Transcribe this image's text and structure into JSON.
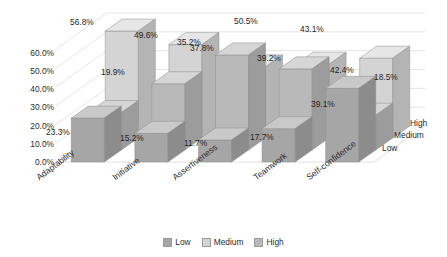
{
  "chart_data": {
    "type": "bar",
    "title": "",
    "subtitle": "",
    "xlabel": "",
    "ylabel": "",
    "categories": [
      "Adaptability",
      "Initiative",
      "Assertiveness",
      "Teamwork",
      "Self-confidence"
    ],
    "series": [
      {
        "name": "Low",
        "values": [
          23.3,
          15.2,
          11.7,
          17.7,
          39.1
        ]
      },
      {
        "name": "Medium",
        "values": [
          56.8,
          49.6,
          37.8,
          39.2,
          42.4
        ]
      },
      {
        "name": "High",
        "values": [
          19.9,
          35.2,
          50.5,
          43.1,
          18.5
        ]
      }
    ],
    "value_labels": {
      "Low": [
        "23.3%",
        "15.2%",
        "11.7%",
        "17.7%",
        "39.1%"
      ],
      "Medium": [
        "56.8%",
        "49.6%",
        "37.8%",
        "39.2%",
        "42.4%"
      ],
      "High": [
        "19.9%",
        "35.2%",
        "50.5%",
        "43.1%",
        "18.5%"
      ]
    },
    "ylim": [
      0,
      60
    ],
    "ytick_labels": [
      "0.0%",
      "10.0%",
      "20.0%",
      "30.0%",
      "40.0%",
      "50.0%",
      "60.0%"
    ],
    "ytick_values": [
      0,
      10,
      20,
      30,
      40,
      50,
      60
    ],
    "depth_axis_labels": [
      "High",
      "Medium",
      "Low"
    ],
    "legend": {
      "position": "bottom",
      "entries": [
        "Low",
        "Medium",
        "High"
      ]
    },
    "grid": true,
    "three_d": true,
    "colors": {
      "low_front": "#a6a6a6",
      "low_top": "#c9c9c9",
      "low_side": "#8c8c8c",
      "medium_front": "#d4d4d4",
      "medium_top": "#e6e6e6",
      "medium_side": "#b4b4b4",
      "high_front": "#b9b9b9",
      "high_top": "#d6d6d6",
      "high_side": "#9c9c9c",
      "grid_line": "#d9d9d9",
      "text": "#2b2b2b",
      "plot_background": "#ffffff"
    }
  }
}
